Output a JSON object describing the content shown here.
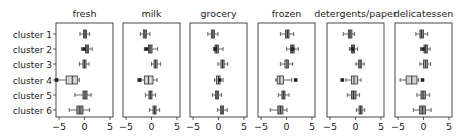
{
  "chart_data": {
    "type": "boxplot",
    "layout": "1x6 small multiples, shared y (clusters), independent x panels",
    "grid": false,
    "legend": null,
    "categories": [
      "cluster 1",
      "cluster 2",
      "cluster 3",
      "cluster 4",
      "cluster 5",
      "cluster 6"
    ],
    "xlim": [
      -5.6,
      5.6
    ],
    "xticks": [
      -5,
      0,
      5
    ],
    "xtick_labels": [
      "−5",
      "0",
      "5"
    ],
    "box_colors": [
      "#8c8c8c",
      "#8c8c8c",
      "#a9a9a9",
      "#d4d4d4",
      "#8c8c8c",
      "#8c8c8c"
    ],
    "panels": [
      {
        "title": "fresh",
        "boxes": [
          {
            "q1": -0.2,
            "med": 0.1,
            "q3": 0.4,
            "wlo": -0.9,
            "whi": 1.0,
            "fliers": []
          },
          {
            "q1": 0.2,
            "med": 0.5,
            "q3": 0.8,
            "wlo": -0.6,
            "whi": 1.5,
            "fliers": [
              -0.1
            ]
          },
          {
            "q1": -0.3,
            "med": 0.0,
            "q3": 0.3,
            "wlo": -1.0,
            "whi": 0.9,
            "fliers": []
          },
          {
            "q1": -3.6,
            "med": -2.4,
            "q3": -1.4,
            "wlo": -5.3,
            "whi": -1.0,
            "fliers": [
              -5.5
            ]
          },
          {
            "q1": -0.3,
            "med": 0.1,
            "q3": 0.5,
            "wlo": -1.9,
            "whi": 1.3,
            "fliers": []
          },
          {
            "q1": -1.5,
            "med": -0.9,
            "q3": -0.3,
            "wlo": -3.0,
            "whi": 1.0,
            "fliers": []
          }
        ]
      },
      {
        "title": "milk",
        "boxes": [
          {
            "q1": -1.6,
            "med": -1.3,
            "q3": -1.0,
            "wlo": -2.2,
            "whi": -0.3,
            "fliers": []
          },
          {
            "q1": -0.6,
            "med": -0.3,
            "q3": 0.1,
            "wlo": -1.4,
            "whi": 1.2,
            "fliers": [
              -1.0
            ]
          },
          {
            "q1": 0.5,
            "med": 0.8,
            "q3": 1.1,
            "wlo": 0.0,
            "whi": 1.8,
            "fliers": []
          },
          {
            "q1": -1.4,
            "med": -0.6,
            "q3": 0.3,
            "wlo": -2.0,
            "whi": 1.1,
            "fliers": [
              -2.4
            ]
          },
          {
            "q1": -0.5,
            "med": -0.2,
            "q3": 0.1,
            "wlo": -1.2,
            "whi": 0.8,
            "fliers": []
          },
          {
            "q1": 0.3,
            "med": 0.6,
            "q3": 0.9,
            "wlo": -0.4,
            "whi": 1.6,
            "fliers": []
          }
        ]
      },
      {
        "title": "grocery",
        "boxes": [
          {
            "q1": -1.4,
            "med": -1.1,
            "q3": -0.8,
            "wlo": -2.1,
            "whi": -0.1,
            "fliers": []
          },
          {
            "q1": -0.7,
            "med": -0.4,
            "q3": 0.0,
            "wlo": -1.0,
            "whi": 0.9,
            "fliers": [
              -0.6
            ]
          },
          {
            "q1": 0.5,
            "med": 0.8,
            "q3": 1.1,
            "wlo": -0.1,
            "whi": 1.8,
            "fliers": []
          },
          {
            "q1": -0.4,
            "med": 0.0,
            "q3": 0.3,
            "wlo": -0.8,
            "whi": 0.9,
            "fliers": [
              0.2
            ]
          },
          {
            "q1": -0.6,
            "med": -0.3,
            "q3": 0.0,
            "wlo": -1.2,
            "whi": 0.6,
            "fliers": []
          },
          {
            "q1": 0.4,
            "med": 0.7,
            "q3": 1.0,
            "wlo": -0.2,
            "whi": 1.7,
            "fliers": []
          }
        ]
      },
      {
        "title": "frozen",
        "boxes": [
          {
            "q1": -0.2,
            "med": 0.2,
            "q3": 0.5,
            "wlo": -1.2,
            "whi": 1.4,
            "fliers": []
          },
          {
            "q1": 0.8,
            "med": 1.1,
            "q3": 1.5,
            "wlo": 0.0,
            "whi": 2.3,
            "fliers": [
              1.2
            ]
          },
          {
            "q1": -0.3,
            "med": 0.1,
            "q3": 0.4,
            "wlo": -1.2,
            "whi": 1.2,
            "fliers": []
          },
          {
            "q1": -1.8,
            "med": -1.3,
            "q3": -0.6,
            "wlo": -2.1,
            "whi": 1.0,
            "fliers": [
              1.8
            ]
          },
          {
            "q1": -0.9,
            "med": -0.6,
            "q3": -0.3,
            "wlo": -1.6,
            "whi": 0.5,
            "fliers": []
          },
          {
            "q1": -1.7,
            "med": -1.2,
            "q3": -0.7,
            "wlo": -3.2,
            "whi": 0.1,
            "fliers": []
          }
        ]
      },
      {
        "title": "detergents/paper",
        "boxes": [
          {
            "q1": -1.4,
            "med": -1.1,
            "q3": -0.7,
            "wlo": -2.4,
            "whi": -0.2,
            "fliers": []
          },
          {
            "q1": -0.8,
            "med": -0.5,
            "q3": -0.2,
            "wlo": -1.2,
            "whi": 0.4,
            "fliers": [
              -0.6
            ]
          },
          {
            "q1": 0.6,
            "med": 0.9,
            "q3": 1.2,
            "wlo": 0.1,
            "whi": 1.7,
            "fliers": []
          },
          {
            "q1": -0.8,
            "med": -0.3,
            "q3": 0.4,
            "wlo": -1.9,
            "whi": 1.1,
            "fliers": [
              -2.6
            ]
          },
          {
            "q1": -0.8,
            "med": -0.4,
            "q3": 0.1,
            "wlo": -1.6,
            "whi": 0.8,
            "fliers": []
          },
          {
            "q1": 0.7,
            "med": 1.0,
            "q3": 1.3,
            "wlo": 0.2,
            "whi": 1.8,
            "fliers": []
          }
        ]
      },
      {
        "title": "delicatessen",
        "boxes": [
          {
            "q1": -0.7,
            "med": -0.4,
            "q3": 0.0,
            "wlo": -1.5,
            "whi": 0.8,
            "fliers": []
          },
          {
            "q1": 0.1,
            "med": 0.4,
            "q3": 0.8,
            "wlo": -0.6,
            "whi": 1.3,
            "fliers": [
              -0.1
            ]
          },
          {
            "q1": 0.0,
            "med": 0.4,
            "q3": 0.8,
            "wlo": -0.7,
            "whi": 1.4,
            "fliers": []
          },
          {
            "q1": -3.4,
            "med": -2.3,
            "q3": -1.3,
            "wlo": -4.6,
            "whi": -1.0,
            "fliers": [
              -0.2
            ]
          },
          {
            "q1": -0.5,
            "med": -0.1,
            "q3": 0.4,
            "wlo": -1.3,
            "whi": 1.2,
            "fliers": []
          },
          {
            "q1": -0.8,
            "med": -0.2,
            "q3": 0.4,
            "wlo": -2.0,
            "whi": 1.5,
            "fliers": []
          }
        ]
      }
    ]
  }
}
